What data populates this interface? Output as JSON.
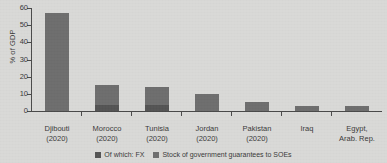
{
  "chart_data": {
    "type": "bar",
    "stacked": true,
    "title": "",
    "xlabel": "",
    "ylabel": "% of GDP",
    "ylim": [
      0,
      60
    ],
    "yticks": [
      0,
      10,
      20,
      30,
      40,
      50,
      60
    ],
    "grid": false,
    "legend_position": "bottom",
    "categories": [
      {
        "name": "Djibouti",
        "year": "(2020)"
      },
      {
        "name": "Morocco",
        "year": "(2020)"
      },
      {
        "name": "Tunisia",
        "year": "(2020)"
      },
      {
        "name": "Jordan",
        "year": "(2020)"
      },
      {
        "name": "Pakistan",
        "year": "(2020)"
      },
      {
        "name": "Iraq",
        "year": ""
      },
      {
        "name": "Egypt,",
        "year": "Arab. Rep."
      }
    ],
    "series": [
      {
        "name": "Stock of government guarantees to SOEs",
        "color": "#6e6e6e",
        "values": [
          57,
          15,
          14,
          10,
          5,
          3,
          3
        ]
      },
      {
        "name": "Of which: FX",
        "color": "#545454",
        "values": [
          0,
          3.5,
          3.5,
          0,
          0,
          0,
          0
        ]
      }
    ]
  }
}
